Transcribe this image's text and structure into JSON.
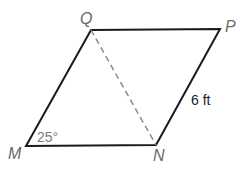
{
  "figure": {
    "type": "parallelogram",
    "vertices": {
      "Q": {
        "label": "Q",
        "x": 91,
        "y": 30
      },
      "P": {
        "label": "P",
        "x": 220,
        "y": 29
      },
      "N": {
        "label": "N",
        "x": 156,
        "y": 145
      },
      "M": {
        "label": "M",
        "x": 26,
        "y": 146
      }
    },
    "diagonal": {
      "from": "Q",
      "to": "N",
      "style": "dashed"
    },
    "angle_label": "25°",
    "side_label": "6 ft",
    "colors": {
      "stroke": "#1a1a1a",
      "dashed": "#8a8a8a",
      "vertex_label": "#6a6a6a"
    }
  }
}
